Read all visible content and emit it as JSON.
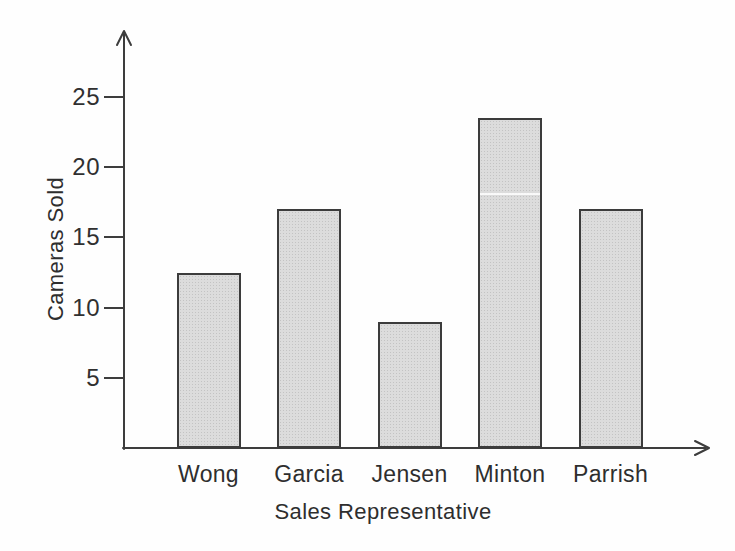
{
  "figure": {
    "background": "#fefefe",
    "axis_color": "#3d3d3d",
    "text_color": "#2e2e2e"
  },
  "chart_data": {
    "type": "bar",
    "title": "",
    "categories": [
      "Wong",
      "Garcia",
      "Jensen",
      "Minton",
      "Parrish"
    ],
    "values": [
      12.5,
      17,
      9,
      23.5,
      17
    ],
    "xlabel": "Sales Representative",
    "ylabel": "Cameras Sold",
    "yticks": [
      5,
      10,
      15,
      20,
      25
    ],
    "ylim": [
      0,
      29
    ],
    "grid": false,
    "legend": "none",
    "bar_fill": "#dcdcdc",
    "bar_border": "#3c3c3c"
  }
}
